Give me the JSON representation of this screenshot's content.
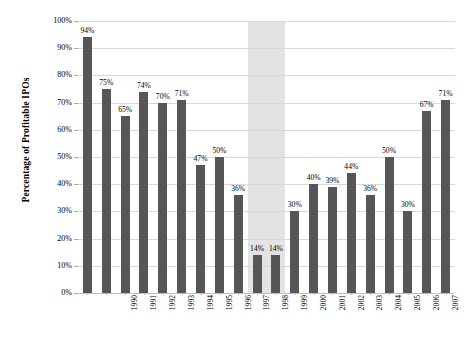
{
  "chart_data": {
    "type": "bar",
    "title": "",
    "xlabel": "",
    "ylabel": "Percentage of Profitable IPOs",
    "ylim": [
      0,
      100
    ],
    "ytick_labels": [
      "0%",
      "10%",
      "20%",
      "30%",
      "40%",
      "50%",
      "60%",
      "70%",
      "80%",
      "90%",
      "100%"
    ],
    "ytick_values": [
      0,
      10,
      20,
      30,
      40,
      50,
      60,
      70,
      80,
      90,
      100
    ],
    "grid": true,
    "legend": "none",
    "categories": [
      "1990",
      "1991",
      "1992",
      "1993",
      "1994",
      "1995",
      "1996",
      "1997",
      "1998",
      "1999",
      "2000",
      "2001",
      "2002",
      "2003",
      "2004",
      "2005",
      "2006",
      "2007",
      "2008",
      "2009"
    ],
    "values": [
      94,
      75,
      65,
      74,
      70,
      71,
      47,
      50,
      36,
      14,
      14,
      30,
      40,
      39,
      44,
      36,
      50,
      30,
      67,
      71
    ],
    "value_labels": [
      "94%",
      "75%",
      "65%",
      "74%",
      "70%",
      "71%",
      "47%",
      "50%",
      "36%",
      "14%",
      "14%",
      "30%",
      "40%",
      "39%",
      "44%",
      "36%",
      "50%",
      "30%",
      "67%",
      "71%"
    ],
    "bar_color": "#565656",
    "gridline_color": "#d9d9d9",
    "highlight_band": {
      "label": "",
      "from_category": "1999",
      "to_category": "2000",
      "color": "#e3e3e3"
    }
  }
}
